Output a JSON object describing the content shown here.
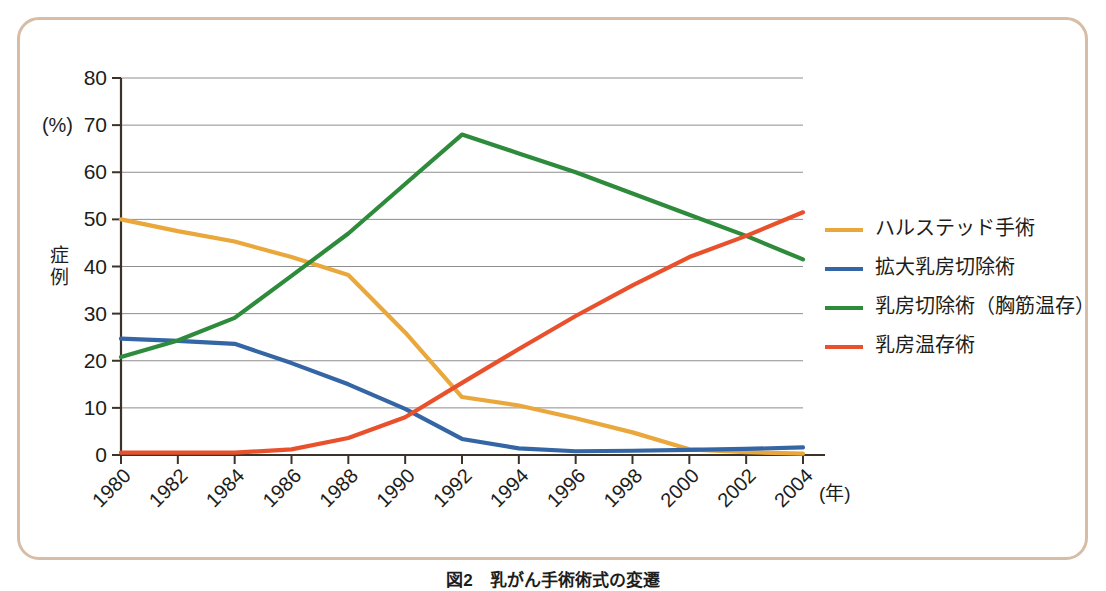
{
  "figure": {
    "caption": "図2　乳がん手術術式の変遷",
    "frame_color": "#d7bda6",
    "background": "#ffffff"
  },
  "chart_data": {
    "type": "line",
    "title": "",
    "xlabel": "(年)",
    "ylabel": "症例",
    "yunit": "(%)",
    "ylim": [
      0,
      80
    ],
    "ytick_step": 10,
    "yticks": [
      "0",
      "10",
      "20",
      "30",
      "40",
      "50",
      "60",
      "70",
      "80"
    ],
    "grid": true,
    "grid_axis": "y",
    "legend_position": "right",
    "categories": [
      "1980",
      "1982",
      "1984",
      "1986",
      "1988",
      "1990",
      "1992",
      "1994",
      "1996",
      "1998",
      "2000",
      "2002",
      "2004"
    ],
    "x": [
      1980,
      1982,
      1984,
      1986,
      1988,
      1990,
      1992,
      1994,
      1996,
      1998,
      2000,
      2002,
      2004
    ],
    "series": [
      {
        "name": "ハルステッド手術",
        "color": "#eaa73c",
        "values": [
          50.0,
          47.5,
          45.3,
          42.0,
          38.2,
          26.0,
          12.3,
          10.5,
          7.8,
          4.8,
          1.2,
          0.6,
          0.3
        ]
      },
      {
        "name": "拡大乳房切除術",
        "color": "#3465a4",
        "values": [
          24.7,
          24.2,
          23.6,
          19.5,
          15.0,
          9.8,
          3.4,
          1.4,
          0.8,
          0.9,
          1.1,
          1.3,
          1.6
        ]
      },
      {
        "name": "乳房切除術（胸筋温存）",
        "color": "#2e8b3c",
        "values": [
          20.8,
          24.3,
          29.1,
          38.0,
          47.0,
          57.5,
          68.0,
          64.0,
          60.0,
          55.5,
          51.0,
          46.5,
          41.5
        ]
      },
      {
        "name": "乳房温存術",
        "color": "#e8512c",
        "values": [
          0.5,
          0.5,
          0.5,
          1.2,
          3.6,
          8.0,
          15.3,
          22.5,
          29.5,
          36.0,
          42.0,
          46.5,
          51.5
        ]
      }
    ]
  },
  "axes": {
    "y_unit_label": "(%)",
    "y_title_chars": [
      "症",
      "例"
    ],
    "x_unit_label": "(年)"
  },
  "legend": {
    "items": [
      {
        "label": "ハルステッド手術",
        "color": "#eaa73c"
      },
      {
        "label": "拡大乳房切除術",
        "color": "#3465a4"
      },
      {
        "label": "乳房切除術（胸筋温存）",
        "color": "#2e8b3c"
      },
      {
        "label": "乳房温存術",
        "color": "#e8512c"
      }
    ]
  }
}
